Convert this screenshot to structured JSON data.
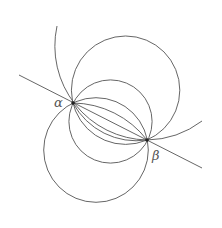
{
  "diagram": {
    "stroke_color": "#555555",
    "points": [
      {
        "name": "alpha",
        "label": "α",
        "x": 73,
        "y": 103
      },
      {
        "name": "beta",
        "label": "β",
        "x": 147,
        "y": 140
      }
    ],
    "labels": {
      "alpha": "α",
      "beta": "β"
    },
    "line": {
      "x1": 19,
      "y1": 75,
      "x2": 202,
      "y2": 168
    },
    "circles": [
      {
        "name": "top-circle",
        "cx": 125.6,
        "cy": 90.2,
        "r": 54.2
      },
      {
        "name": "middle-circle",
        "cx": 110.5,
        "cy": 121.5,
        "r": 41.6
      },
      {
        "name": "bottom-left-circle",
        "cx": 96,
        "cy": 150,
        "r": 52.3
      }
    ]
  }
}
